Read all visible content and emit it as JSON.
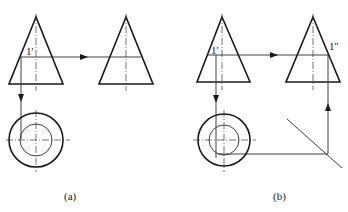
{
  "diagram": {
    "colors": {
      "line": "#1a1a1a",
      "background": "#ffffff"
    },
    "figures": [
      {
        "id": "a",
        "caption": "(a)",
        "point_labels": {
          "front": "1'"
        },
        "views": [
          "front-view-triangle",
          "side-view-triangle",
          "top-view-circles"
        ]
      },
      {
        "id": "b",
        "caption": "(b)",
        "point_labels": {
          "front": "1'",
          "side": "1''"
        },
        "views": [
          "front-view-triangle",
          "side-view-triangle",
          "top-view-circles",
          "45-degree-miter-line"
        ]
      }
    ]
  }
}
